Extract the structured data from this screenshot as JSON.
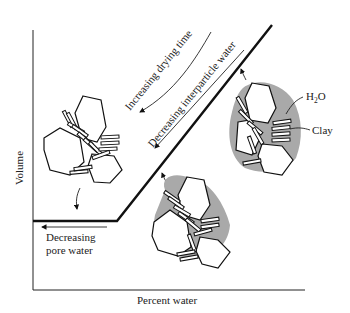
{
  "figure": {
    "axes": {
      "y_label": "Volume",
      "x_label": "Percent water"
    },
    "annotations": {
      "increasing_drying_time": "Increasing drying time",
      "decreasing_interparticle_water": "Decreasing interparticle water",
      "decreasing_pore_water_line1": "Decreasing",
      "decreasing_pore_water_line2": "pore water",
      "h2o_label_main": "H",
      "h2o_label_sub": "2",
      "h2o_label_end": "O",
      "clay_label": "Clay"
    },
    "colors": {
      "ink": "#111111",
      "water_fill": "#a9a9a9",
      "background": "#ffffff"
    }
  }
}
